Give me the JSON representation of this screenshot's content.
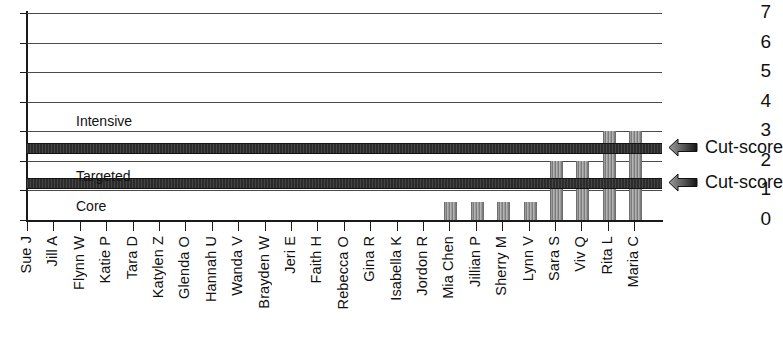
{
  "chart_data": {
    "type": "bar",
    "title": "",
    "xlabel": "",
    "ylabel": "",
    "ylim": [
      0,
      7
    ],
    "yticks": [
      0,
      1,
      2,
      3,
      4,
      5,
      6,
      7
    ],
    "grid": true,
    "legend_position": "none",
    "categories": [
      "Sue J",
      "Jill A",
      "Flynn W",
      "Katie P",
      "Tara D",
      "Katylen Z",
      "Glenda O",
      "Hannah U",
      "Wanda V",
      "Brayden W",
      "Jeri E",
      "Faith H",
      "Rebecca O",
      "Gina R",
      "Isabella K",
      "Jordon R",
      "Mia Chen",
      "Jillian P",
      "Sherry M",
      "Lynn V",
      "Sara S",
      "Viv Q",
      "Rita L",
      "Maria C"
    ],
    "values": [
      0,
      0,
      0,
      0,
      0,
      0,
      0,
      0,
      0,
      0,
      0,
      0,
      0,
      0,
      0,
      0,
      0.6,
      0.6,
      0.6,
      0.6,
      2.0,
      2.0,
      3.0,
      3.0
    ],
    "bands": [
      {
        "label": "Intensive",
        "y": 3.3
      },
      {
        "label": "Targeted",
        "y": 1.45
      },
      {
        "label": "Core",
        "y": 0.45
      }
    ],
    "cut_scores": [
      {
        "label": "Cut-score",
        "value": 2.45
      },
      {
        "label": "Cut-score",
        "value": 1.25
      }
    ],
    "colors": {
      "bar": "#8e8e8e",
      "cut_band": "#2b2b2b",
      "grid": "#4a4a4a",
      "axis": "#1a1a1a",
      "text": "#111111"
    },
    "icons": {
      "cut_score_arrow": "arrow-left-icon"
    }
  }
}
